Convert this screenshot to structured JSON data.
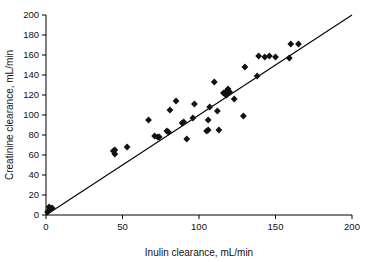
{
  "chart_data": {
    "type": "scatter",
    "title": "",
    "subtitle": "",
    "xlabel": "Inulin clearance, mL/min",
    "ylabel": "Creatinine clearance, mL/min",
    "xlim": [
      0,
      200
    ],
    "ylim": [
      0,
      200
    ],
    "xticks": [
      0,
      50,
      100,
      150,
      200
    ],
    "yticks": [
      0,
      20,
      40,
      60,
      80,
      100,
      120,
      140,
      160,
      180,
      200
    ],
    "xtick_labels": [
      "0",
      "50",
      "100",
      "150",
      "200"
    ],
    "ytick_labels": [
      "0",
      "20",
      "40",
      "60",
      "80",
      "100",
      "120",
      "140",
      "160",
      "180",
      "200"
    ],
    "grid": false,
    "legend": null,
    "legend_position": "none",
    "marker": "diamond",
    "marker_color": "#111111",
    "reference_line": {
      "name": "line-of-identity",
      "type": "line",
      "from": [
        0,
        0
      ],
      "to": [
        200,
        200
      ],
      "slope": 1,
      "intercept": 0,
      "color": "#000000"
    },
    "series": [
      {
        "name": "patients",
        "points": [
          [
            1,
            3
          ],
          [
            2,
            5
          ],
          [
            2,
            8
          ],
          [
            4,
            7
          ],
          [
            44,
            64
          ],
          [
            45,
            61
          ],
          [
            45,
            65
          ],
          [
            53,
            68
          ],
          [
            67,
            95
          ],
          [
            71,
            79
          ],
          [
            73,
            78
          ],
          [
            74,
            78
          ],
          [
            79,
            84
          ],
          [
            80,
            83
          ],
          [
            81,
            105
          ],
          [
            85,
            114
          ],
          [
            89,
            92
          ],
          [
            90,
            93
          ],
          [
            92,
            76
          ],
          [
            96,
            97
          ],
          [
            97,
            111
          ],
          [
            105,
            84
          ],
          [
            106,
            85
          ],
          [
            106,
            95
          ],
          [
            107,
            108
          ],
          [
            110,
            133
          ],
          [
            112,
            104
          ],
          [
            113,
            85
          ],
          [
            116,
            122
          ],
          [
            117,
            121
          ],
          [
            118,
            124
          ],
          [
            118,
            120
          ],
          [
            119,
            126
          ],
          [
            120,
            123
          ],
          [
            123,
            116
          ],
          [
            129,
            99
          ],
          [
            130,
            148
          ],
          [
            138,
            139
          ],
          [
            139,
            159
          ],
          [
            143,
            158
          ],
          [
            146,
            159
          ],
          [
            150,
            158
          ],
          [
            159,
            157
          ],
          [
            160,
            171
          ],
          [
            165,
            171
          ]
        ]
      }
    ]
  },
  "axes": {
    "x_title": "Inulin clearance, mL/min",
    "y_title": "Creatinine clearance, mL/min"
  }
}
